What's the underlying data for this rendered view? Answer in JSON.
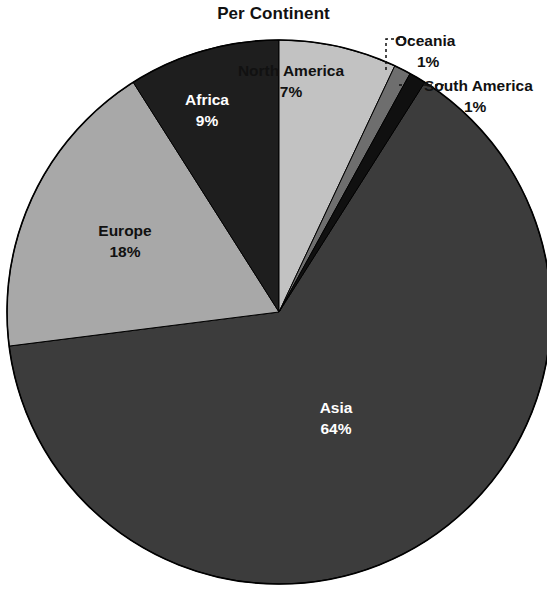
{
  "chart_data": {
    "type": "pie",
    "title": "Per Continent",
    "xlabel": "",
    "ylabel": "",
    "legend": "none",
    "grid": false,
    "start_angle_deg": 0,
    "direction": "clockwise",
    "categories": [
      "North America",
      "Oceania",
      "South America",
      "Asia",
      "Europe",
      "Africa"
    ],
    "values": [
      7,
      1,
      1,
      64,
      18,
      9
    ],
    "value_labels": [
      "7%",
      "1%",
      "1%",
      "64%",
      "18%",
      "9%"
    ],
    "slices": [
      {
        "name": "North America",
        "value": 7,
        "value_label": "7%",
        "color": "#c2c2c2",
        "label_color": "#111111",
        "label_placement": "inside",
        "leader_line": false
      },
      {
        "name": "Oceania",
        "value": 1,
        "value_label": "1%",
        "color": "#6e6e6e",
        "label_color": "#111111",
        "label_placement": "outside",
        "leader_line": true
      },
      {
        "name": "South America",
        "value": 1,
        "value_label": "1%",
        "color": "#101010",
        "label_color": "#111111",
        "label_placement": "outside",
        "leader_line": true
      },
      {
        "name": "Asia",
        "value": 64,
        "value_label": "64%",
        "color": "#3c3c3c",
        "label_color": "#ffffff",
        "label_placement": "inside",
        "leader_line": false
      },
      {
        "name": "Europe",
        "value": 18,
        "value_label": "18%",
        "color": "#a8a8a8",
        "label_color": "#111111",
        "label_placement": "inside",
        "leader_line": false
      },
      {
        "name": "Africa",
        "value": 9,
        "value_label": "9%",
        "color": "#1e1e1e",
        "label_color": "#ffffff",
        "label_placement": "inside",
        "leader_line": false
      }
    ]
  },
  "chart": {
    "title": "Per Continent",
    "background": "#ffffff",
    "outline_color": "#000000"
  },
  "labels": {
    "north_america": {
      "name": "North America",
      "pct": "7%"
    },
    "africa": {
      "name": "Africa",
      "pct": "9%"
    },
    "europe": {
      "name": "Europe",
      "pct": "18%"
    },
    "asia": {
      "name": "Asia",
      "pct": "64%"
    },
    "oceania": {
      "name": "Oceania",
      "pct": "1%"
    },
    "south_america": {
      "name": "South America",
      "pct": "1%"
    }
  }
}
